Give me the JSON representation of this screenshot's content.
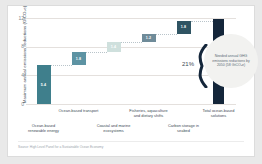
{
  "chart_data": {
    "type": "bar",
    "subtype": "waterfall",
    "title": "",
    "xlabel": "",
    "ylabel": "Maximum annual emissions reductions (GtCO₂e)",
    "ylim": [
      0,
      12
    ],
    "yticks": [
      "0",
      "4",
      "8",
      "12"
    ],
    "grid": true,
    "legend": "none",
    "categories": [
      "Ocean-based renewable energy",
      "Ocean-based transport",
      "Coastal and marine ecosystems",
      "Fisheries, aquaculture and dietary shifts",
      "Carbon storage in seabed",
      "Total ocean-based solutions"
    ],
    "values": [
      5.4,
      1.8,
      1.4,
      1.2,
      1.8,
      11.8
    ],
    "bar_labels": [
      "5.4",
      "1.8",
      "1.4",
      "1.2",
      "1.8",
      "11.8"
    ],
    "bar_bases": [
      0,
      5.4,
      7.2,
      8.6,
      9.8,
      0
    ],
    "bar_colors": [
      "#3f7f8c",
      "#5d93a3",
      "#cfe0dd",
      "#6f8b99",
      "#2f5463",
      "#14263a"
    ],
    "is_total": [
      false,
      false,
      false,
      false,
      false,
      true
    ],
    "annotations": {
      "percent": "21%",
      "bubble": "Needed annual GHG emissions reductions by 2050 (58 GtCO₂e)"
    }
  },
  "source": "Source: High Level Panel for a Sustainable Ocean Economy"
}
